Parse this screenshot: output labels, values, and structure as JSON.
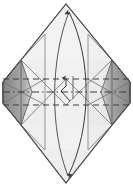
{
  "figure": {
    "kind": "origami-folding-diagram",
    "canvas": {
      "width": 133,
      "height": 187
    },
    "background_color": "#ffffff"
  },
  "colors": {
    "paper_front": "#ececec",
    "paper_front_light": "#f2f2f2",
    "paper_highlight": "#f6f6f6",
    "paper_shadow": "#e2e2e2",
    "flap_dark": "#8e8e8e",
    "flap_mid": "#a8a8a8",
    "flap_light": "#c6c6c6",
    "outline": "#4a4a4a",
    "crease_line": "#8a8a8a",
    "fold_dash": "#3c3c3c",
    "arrow": "#3a3a3a"
  },
  "shape": {
    "name": "hexagonal-diamond-sheet",
    "points": "66,4 112,60 130,82 130,103 112,125 66,183 21,125 3,103 3,82 21,60",
    "top_vertex": {
      "x": 66,
      "y": 4
    },
    "bottom_vertex": {
      "x": 66,
      "y": 183
    },
    "left_vertex": {
      "x": 3,
      "y": 92
    },
    "right_vertex": {
      "x": 130,
      "y": 92
    }
  },
  "flaps": [
    {
      "name": "left-dark-flap",
      "side": "left",
      "points": "3,82 3,103 21,125 29,92 21,60",
      "fill": "#8e8e8e"
    },
    {
      "name": "left-mid-flap",
      "side": "left",
      "points": "21,60 29,92 21,125",
      "fill": "#a8a8a8"
    },
    {
      "name": "right-dark-flap",
      "side": "right",
      "points": "130,82 130,103 112,125 104,92 112,60",
      "fill": "#8e8e8e"
    },
    {
      "name": "right-mid-flap",
      "side": "right",
      "points": "112,60 104,92 112,125",
      "fill": "#a8a8a8"
    }
  ],
  "fold_lines": {
    "valley_dashed": [
      {
        "name": "upper-valley-fold",
        "y": 79,
        "x1": 3,
        "x2": 130,
        "style": "dashed"
      },
      {
        "name": "lower-valley-fold",
        "y": 105,
        "x1": 3,
        "x2": 130,
        "style": "dashed"
      }
    ],
    "mountain_dash_dot": [
      {
        "name": "center-mountain-fold",
        "y": 92,
        "x1": 3,
        "x2": 130,
        "style": "dash-dot"
      }
    ],
    "vertical_creases": [
      {
        "name": "left-vertical-crease",
        "x": 45,
        "y1": 34,
        "y2": 150
      },
      {
        "name": "right-vertical-crease",
        "x": 88,
        "y1": 34,
        "y2": 150
      }
    ],
    "diagonal_creases": [
      {
        "name": "upper-left-diagonal",
        "x1": 21,
        "y1": 60,
        "x2": 66,
        "y2": 105
      },
      {
        "name": "upper-right-diagonal",
        "x1": 112,
        "y1": 60,
        "x2": 66,
        "y2": 105
      },
      {
        "name": "lower-left-diagonal",
        "x1": 21,
        "y1": 125,
        "x2": 66,
        "y2": 79
      },
      {
        "name": "lower-right-diagonal",
        "x1": 112,
        "y1": 125,
        "x2": 66,
        "y2": 79
      },
      {
        "name": "left-flap-crease-top",
        "x1": 3,
        "y1": 82,
        "x2": 45,
        "y2": 105
      },
      {
        "name": "left-flap-crease-bottom",
        "x1": 3,
        "y1": 103,
        "x2": 45,
        "y2": 79
      },
      {
        "name": "right-flap-crease-top",
        "x1": 130,
        "y1": 82,
        "x2": 88,
        "y2": 105
      },
      {
        "name": "right-flap-crease-bottom",
        "x1": 130,
        "y1": 103,
        "x2": 88,
        "y2": 79
      }
    ]
  },
  "arrows": [
    {
      "name": "main-fold-arrow",
      "type": "curved-double-headed",
      "path": "M 68,10 C 92,58 92,128 68,178",
      "head_top": {
        "x": 68,
        "y": 10,
        "direction": "up"
      },
      "head_bottom": {
        "x": 68,
        "y": 178,
        "direction": "down"
      },
      "description": "Large curved arrow sweeping from bottom point to top point"
    },
    {
      "name": "center-small-arrow",
      "type": "bent-arrow",
      "path": "M 68,100 L 60,90 L 66,84 L 66,73",
      "head": {
        "x": 66,
        "y": 73,
        "direction": "up"
      },
      "description": "Small bent arrow in the middle pointing upward"
    },
    {
      "name": "center-stem-line",
      "type": "line",
      "path": "M 72,96 L 72,74",
      "description": "Short vertical reference line beside the small arrow"
    }
  ],
  "labels": {
    "step_number": "",
    "caption": ""
  }
}
